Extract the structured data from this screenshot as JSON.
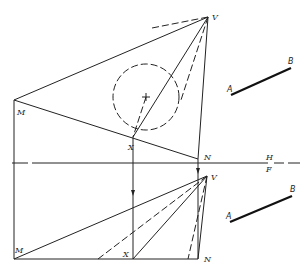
{
  "figure": {
    "labels": {
      "top_vertex": "V",
      "top_M": "M",
      "top_X": "X",
      "top_N": "N",
      "fold_upper": "H",
      "fold_lower": "F",
      "front_vertex": "V",
      "front_M": "M",
      "front_X": "X",
      "front_N": "N",
      "top_A": "A",
      "top_B": "B",
      "front_A": "A",
      "front_B": "B"
    },
    "colors": {
      "ink": "#222222",
      "background": "#ffffff"
    },
    "geometry": {
      "top_view": {
        "V": [
          208,
          17
        ],
        "M": [
          14,
          100
        ],
        "X": [
          133,
          137
        ],
        "N": [
          198,
          159
        ],
        "circle_center": [
          146,
          97
        ],
        "circle_radius": 33
      },
      "fold_line_y": 163,
      "front_view": {
        "V": [
          207,
          176
        ],
        "M": [
          14,
          259
        ],
        "X": [
          133,
          259
        ],
        "N": [
          198,
          259
        ]
      },
      "segment_AB_top": [
        [
          231,
          95
        ],
        [
          291,
          68
        ]
      ],
      "segment_AB_front": [
        [
          230,
          222
        ],
        [
          292,
          196
        ]
      ]
    }
  }
}
